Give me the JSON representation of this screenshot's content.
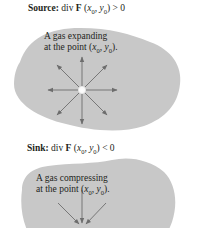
{
  "colors": {
    "blob": "#c8c8c8",
    "arrow": "#6d6d6d",
    "center_point": "#ffffff",
    "text": "#231f20"
  },
  "source": {
    "label": "Source:",
    "expr_prefix": "div ",
    "expr_F": "F",
    "expr_open": " (",
    "x": "x",
    "x_sub": "0",
    "comma": ", ",
    "y": "y",
    "y_sub": "0",
    "expr_close": ") > 0",
    "caption_line1": "A gas expanding",
    "caption_line2_prefix": "at the point (",
    "caption_close": ").",
    "arrows": [
      "up",
      "up-right",
      "right",
      "down-right",
      "down",
      "down-left",
      "left",
      "up-left"
    ]
  },
  "sink": {
    "label": "Sink:",
    "expr_prefix": "div ",
    "expr_F": "F",
    "expr_open": " (",
    "x": "x",
    "x_sub": "0",
    "comma": ", ",
    "y": "y",
    "y_sub": "0",
    "expr_close": ") < 0",
    "caption_line1": "A gas compressing",
    "caption_line2_prefix": "at the point (",
    "caption_close": ").",
    "arrows": [
      "from-up-left",
      "from-up",
      "from-up-right"
    ]
  }
}
